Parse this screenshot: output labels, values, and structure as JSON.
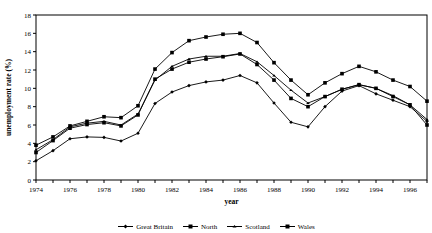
{
  "chart_data": {
    "type": "line",
    "title": "",
    "xlabel": "year",
    "ylabel": "unemployment rate (%)",
    "xlim": [
      1974,
      1997
    ],
    "ylim": [
      0,
      18
    ],
    "ytick_step": 2,
    "yticks": [
      0,
      2,
      4,
      6,
      8,
      10,
      12,
      14,
      16,
      18
    ],
    "xticks": [
      1974,
      1975,
      1976,
      1977,
      1978,
      1979,
      1980,
      1981,
      1982,
      1983,
      1984,
      1985,
      1986,
      1987,
      1988,
      1989,
      1990,
      1991,
      1992,
      1993,
      1994,
      1995,
      1996,
      1997
    ],
    "xtick_labels": [
      "1974",
      "",
      "1976",
      "",
      "1978",
      "",
      "1980",
      "",
      "1982",
      "",
      "1984",
      "",
      "1986",
      "",
      "1988",
      "",
      "1990",
      "",
      "1992",
      "",
      "1994",
      "",
      "1996",
      ""
    ],
    "grid": false,
    "legend_position": "bottom",
    "x": [
      1974,
      1975,
      1976,
      1977,
      1978,
      1979,
      1980,
      1981,
      1982,
      1983,
      1984,
      1985,
      1986,
      1987,
      1988,
      1989,
      1990,
      1991,
      1992,
      1993,
      1994,
      1995,
      1996,
      1997
    ],
    "series": [
      {
        "name": "Great Britain",
        "marker": "diamond",
        "values": [
          2.1,
          3.2,
          4.5,
          4.7,
          4.65,
          4.25,
          5.1,
          8.35,
          9.6,
          10.3,
          10.7,
          10.9,
          11.4,
          10.6,
          8.4,
          6.3,
          5.8,
          8.0,
          9.7,
          10.3,
          9.4,
          8.7,
          8.0,
          6.4
        ]
      },
      {
        "name": "North",
        "marker": "square",
        "values": [
          3.8,
          4.7,
          5.9,
          6.4,
          6.9,
          6.8,
          8.1,
          12.1,
          13.9,
          15.2,
          15.6,
          15.9,
          16.0,
          15.0,
          12.8,
          10.9,
          9.3,
          10.6,
          11.6,
          12.4,
          11.8,
          10.9,
          10.2,
          8.6
        ]
      },
      {
        "name": "Scotland",
        "marker": "triangle",
        "values": [
          3.3,
          4.4,
          5.8,
          6.2,
          6.4,
          6.0,
          7.2,
          10.9,
          12.4,
          13.2,
          13.5,
          13.5,
          13.8,
          12.9,
          11.4,
          9.8,
          8.4,
          9.1,
          9.9,
          10.4,
          10.0,
          9.2,
          8.2,
          6.6
        ]
      },
      {
        "name": "Wales",
        "marker": "square",
        "values": [
          3.0,
          4.3,
          5.65,
          6.05,
          6.25,
          5.9,
          7.1,
          11.0,
          12.1,
          12.85,
          13.2,
          13.45,
          13.75,
          12.6,
          10.9,
          8.9,
          8.0,
          9.1,
          9.9,
          10.4,
          10.0,
          9.1,
          8.2,
          6.0
        ]
      }
    ]
  },
  "legend": {
    "items": [
      {
        "label": "Great Britain"
      },
      {
        "label": "North"
      },
      {
        "label": "Scotland"
      },
      {
        "label": "Wales"
      }
    ]
  }
}
